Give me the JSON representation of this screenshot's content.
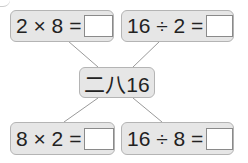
{
  "problems": {
    "top_left": {
      "expression": "2 × 8 =",
      "answer": ""
    },
    "top_right": {
      "expression": "16 ÷ 2 =",
      "answer": ""
    },
    "bottom_left": {
      "expression": "8 × 2 =",
      "answer": ""
    },
    "bottom_right": {
      "expression": "16 ÷ 8 =",
      "answer": ""
    }
  },
  "center": {
    "label": "二八16"
  },
  "colors": {
    "box_fill": "#e6e6e6",
    "box_border": "#b4b4b4",
    "line": "#9a9a9a"
  }
}
